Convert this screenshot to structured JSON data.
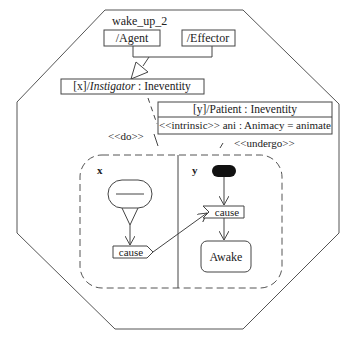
{
  "diagram": {
    "title": "wake_up_2",
    "roles": {
      "agent": "/Agent",
      "effector": "/Effector"
    },
    "instigator": {
      "prefix": "[x]/",
      "role": "Instigator",
      "type": " : Ineventity"
    },
    "patient": {
      "header": "[y]/Patient : Ineventity",
      "attribute": "<<intrinsic>> ani : Animacy = animate"
    },
    "stereotypes": {
      "do": "<<do>>",
      "undergo": "<<undergo>>"
    },
    "partitions": {
      "left_label": "x",
      "right_label": "y"
    },
    "actions": {
      "send_signal": "cause",
      "receive_signal": "cause",
      "state": "Awake"
    }
  }
}
